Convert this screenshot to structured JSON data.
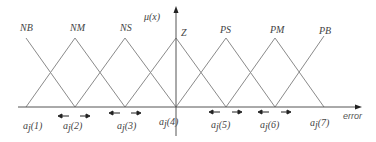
{
  "axis": {
    "y_label": "μ(x)",
    "x_label": "error"
  },
  "sets": [
    {
      "label": "NB",
      "peak_x": 26
    },
    {
      "label": "NM",
      "peak_x": 75
    },
    {
      "label": "NS",
      "peak_x": 125
    },
    {
      "label": "Z",
      "peak_x": 176
    },
    {
      "label": "PS",
      "peak_x": 226
    },
    {
      "label": "PM",
      "peak_x": 275
    },
    {
      "label": "PB",
      "peak_x": 324
    }
  ],
  "points": [
    {
      "label": "a",
      "sub": "j",
      "idx": "(1)"
    },
    {
      "label": "a",
      "sub": "j",
      "idx": "(2)"
    },
    {
      "label": "a",
      "sub": "j",
      "idx": "(3)"
    },
    {
      "label": "a",
      "sub": "j",
      "idx": "(4)"
    },
    {
      "label": "a",
      "sub": "j",
      "idx": "(5)"
    },
    {
      "label": "a",
      "sub": "j",
      "idx": "(6)"
    },
    {
      "label": "a",
      "sub": "j",
      "idx": "(7)"
    }
  ],
  "colors": {
    "line": "#8a8a8a",
    "axis": "#555555",
    "arrow": "#222222"
  }
}
